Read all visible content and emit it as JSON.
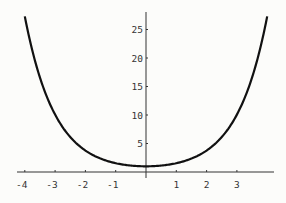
{
  "chart_data": {
    "type": "line",
    "title": "",
    "xlabel": "",
    "ylabel": "",
    "function": "cosh(x)",
    "xlim": [
      -4.25,
      4.2
    ],
    "ylim": [
      0,
      27.5
    ],
    "grid": false,
    "legend": null,
    "x_ticks": [
      -4,
      -3,
      -2,
      -1,
      1,
      2,
      3
    ],
    "x_tick_labels": [
      "-4",
      "-3",
      "-2",
      "-1",
      "1",
      "2",
      "3"
    ],
    "y_ticks": [
      5,
      10,
      15,
      20,
      25
    ],
    "y_tick_labels": [
      "5",
      "10",
      "15",
      "20",
      "25"
    ],
    "series": [
      {
        "name": "curve",
        "x": [
          -4,
          -3.5,
          -3,
          -2.5,
          -2,
          -1.5,
          -1,
          -0.5,
          0,
          0.5,
          1,
          1.5,
          2,
          2.5,
          3,
          3.5,
          4
        ],
        "values": [
          27.31,
          16.57,
          10.07,
          6.13,
          3.76,
          2.35,
          1.54,
          1.13,
          1.0,
          1.13,
          1.54,
          2.35,
          3.76,
          6.13,
          10.07,
          16.57,
          27.31
        ]
      }
    ]
  },
  "colors": {
    "background": "#fcfcfa",
    "curve": "#111111",
    "axis": "#333333"
  }
}
